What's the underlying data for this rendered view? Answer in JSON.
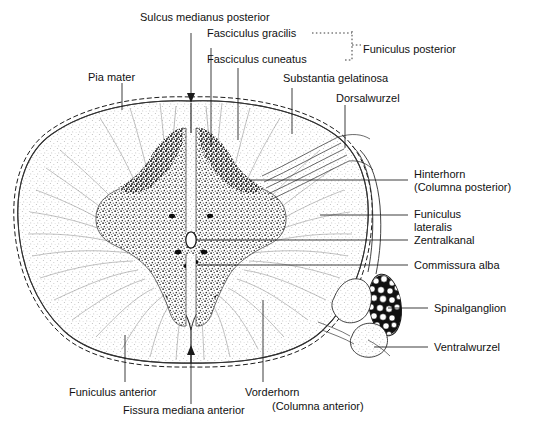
{
  "figure": {
    "background_color": "#ffffff",
    "ink_color": "#111111",
    "width": 540,
    "height": 427
  },
  "labels": {
    "sulcus_medianus_posterior": "Sulcus medianus posterior",
    "fasciculus_gracilis": "Fasciculus gracilis",
    "fasciculus_cuneatus": "Fasciculus cuneatus",
    "funiculus_posterior": "Funiculus posterior",
    "pia_mater": "Pia mater",
    "substantia_gelatinosa": "Substantia gelatinosa",
    "dorsalwurzel": "Dorsalwurzel",
    "hinterhorn": "Hinterhorn",
    "hinterhorn_sub": "(Columna posterior)",
    "funiculus_lateralis_1": "Funiculus",
    "funiculus_lateralis_2": "lateralis",
    "zentralkanal": "Zentralkanal",
    "commissura_alba": "Commissura alba",
    "spinalganglion": "Spinalganglion",
    "ventralwurzel": "Ventralwurzel",
    "funiculus_anterior": "Funiculus anterior",
    "fissura_mediana_anterior": "Fissura mediana anterior",
    "vorderhorn": "Vorderhorn",
    "vorderhorn_sub": "(Columna anterior)"
  },
  "leaders": {
    "dot_leader_gracilis": "..............",
    "bracket_style": "dotted"
  }
}
